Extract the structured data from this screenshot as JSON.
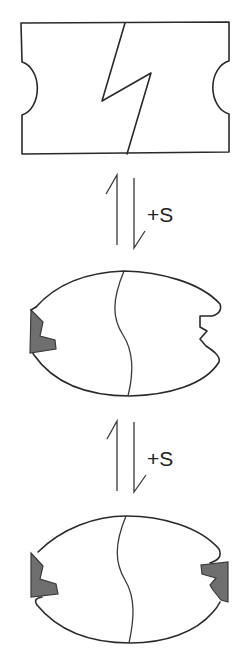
{
  "diagram": {
    "type": "reaction-scheme",
    "stages": [
      {
        "id": "stage-1",
        "description": "rectangular block with two semicircular side notches and a zigzag dividing line"
      },
      {
        "id": "stage-2",
        "description": "oval with wavy divider; left notch filled by one S unit (gray), right notch empty"
      },
      {
        "id": "stage-3",
        "description": "oval with wavy divider; both notches filled by S units (gray)"
      }
    ],
    "arrows": [
      {
        "id": "equilibrium-1",
        "type": "equilibrium-half-arrows",
        "label": "+S"
      },
      {
        "id": "equilibrium-2",
        "type": "equilibrium-half-arrows",
        "label": "+S"
      }
    ],
    "colors": {
      "line": "#2a2a2a",
      "ligand_fill": "#6f6f6f",
      "background": "#ffffff"
    }
  }
}
